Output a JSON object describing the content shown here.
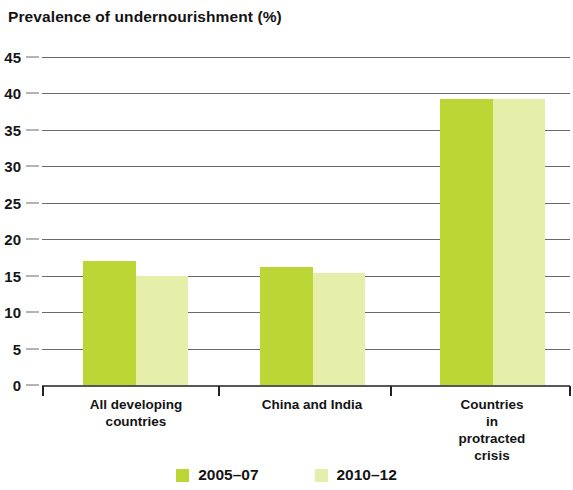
{
  "chart_data": {
    "type": "bar",
    "title": "Prevalence of undernourishment (%)",
    "xlabel": "",
    "ylabel": "",
    "ylim": [
      0,
      45
    ],
    "ytick_step": 5,
    "yticks": [
      "0",
      "5",
      "10",
      "15",
      "20",
      "25",
      "30",
      "35",
      "40",
      "45"
    ],
    "grid": true,
    "legend_position": "bottom",
    "categories": [
      "All developing\ncountries",
      "China and India",
      "Countries\nin protracted crisis"
    ],
    "series": [
      {
        "name": "2005–07",
        "color": "#bcd636",
        "values": [
          17.0,
          16.2,
          39.2
        ]
      },
      {
        "name": "2010–12",
        "color": "#e6efa9",
        "values": [
          14.9,
          15.3,
          39.2
        ]
      }
    ]
  },
  "legend": {
    "items": [
      {
        "label": "2005–07",
        "color": "#bcd636"
      },
      {
        "label": "2010–12",
        "color": "#e6efa9"
      }
    ]
  }
}
